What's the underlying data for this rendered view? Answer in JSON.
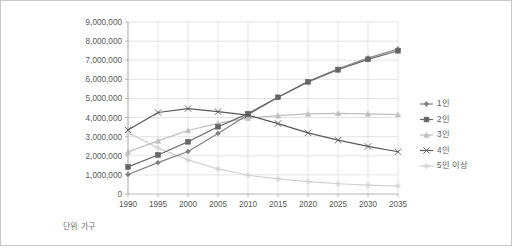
{
  "chart_data": {
    "type": "line",
    "title": "",
    "subtitle": "",
    "xlabel": "",
    "ylabel": "",
    "note": "단위: 가구",
    "categories": [
      "1990",
      "1995",
      "2000",
      "2005",
      "2010",
      "2015",
      "2020",
      "2025",
      "2030",
      "2035"
    ],
    "x": [
      1990,
      1995,
      2000,
      2005,
      2010,
      2015,
      2020,
      2025,
      2030,
      2035
    ],
    "ylim": [
      0,
      9000000
    ],
    "ytick_values": [
      0,
      1000000,
      2000000,
      3000000,
      4000000,
      5000000,
      6000000,
      7000000,
      8000000,
      9000000
    ],
    "ytick_labels": [
      "0",
      "1,000,000",
      "2,000,000",
      "3,000,000",
      "4,000,000",
      "5,000,000",
      "6,000,000",
      "7,000,000",
      "8,000,000",
      "9,000,000"
    ],
    "grid": true,
    "legend_position": "right",
    "series": [
      {
        "name": "1인",
        "marker": "diamond",
        "color": "#808080",
        "values": [
          1021000,
          1642000,
          2224000,
          3171000,
          4142000,
          5062000,
          5885000,
          6551000,
          7116000,
          7590000
        ]
      },
      {
        "name": "2인",
        "marker": "square",
        "color": "#666666",
        "values": [
          1420000,
          2043000,
          2731000,
          3521000,
          4205000,
          5060000,
          5868000,
          6499000,
          7046000,
          7495000
        ]
      },
      {
        "name": "3인",
        "marker": "triangle",
        "color": "#bfbfbf",
        "values": [
          2203000,
          2777000,
          3325000,
          3695000,
          3966000,
          4103000,
          4194000,
          4217000,
          4197000,
          4153000
        ]
      },
      {
        "name": "4인",
        "marker": "x",
        "color": "#595959",
        "values": [
          3352000,
          4263000,
          4472000,
          4309000,
          4129000,
          3685000,
          3198000,
          2816000,
          2489000,
          2210000
        ]
      },
      {
        "name": "5인 이상",
        "marker": "asterisk",
        "color": "#d0d0d0",
        "values": [
          3212000,
          2402000,
          1784000,
          1311000,
          980000,
          790000,
          645000,
          536000,
          462000,
          408000
        ]
      }
    ]
  },
  "legend": {
    "items": [
      {
        "label": "1인"
      },
      {
        "label": "2인"
      },
      {
        "label": "3인"
      },
      {
        "label": "4인"
      },
      {
        "label": "5인 이상"
      }
    ]
  },
  "footnote": {
    "text": "단위: 가구"
  }
}
